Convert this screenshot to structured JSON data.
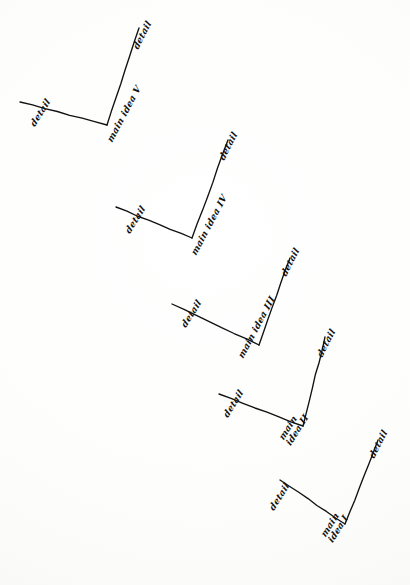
{
  "diagram": {
    "medium": "hand-drawn pen sketch on white paper",
    "ink_color": "#111111",
    "paper_color": "#fefefe",
    "shape_count": 5,
    "shape_type": "v-shape",
    "units": [
      {
        "id": "unit-5",
        "main_label_line1": "main",
        "main_label_line2": "idea",
        "numeral": "V",
        "main_label_full": "main idea V",
        "main_label_single_line": true,
        "left_detail_label": "detail",
        "right_detail_label": "detail",
        "vertex": {
          "x": 107,
          "y": 125
        },
        "left_tip": {
          "x": 20,
          "y": 102
        },
        "right_tip": {
          "x": 139,
          "y": 28
        },
        "main_label_pos": {
          "x": 110,
          "y": 137,
          "rotate": -62
        },
        "left_label_pos": {
          "x": 33,
          "y": 121,
          "rotate": -58
        },
        "right_label_pos": {
          "x": 136,
          "y": 44,
          "rotate": -63
        }
      },
      {
        "id": "unit-4",
        "main_label_line1": "main",
        "main_label_line2": "idea",
        "numeral": "IV",
        "main_label_full": "main idea IV",
        "main_label_single_line": true,
        "left_detail_label": "detail",
        "right_detail_label": "detail",
        "vertex": {
          "x": 192,
          "y": 238
        },
        "left_tip": {
          "x": 116,
          "y": 207
        },
        "right_tip": {
          "x": 228,
          "y": 140
        },
        "main_label_pos": {
          "x": 194,
          "y": 250,
          "rotate": -62
        },
        "left_label_pos": {
          "x": 128,
          "y": 228,
          "rotate": -58
        },
        "right_label_pos": {
          "x": 222,
          "y": 155,
          "rotate": -63
        }
      },
      {
        "id": "unit-3",
        "main_label_line1": "main",
        "main_label_line2": "idea",
        "numeral": "III",
        "main_label_full": "main idea III",
        "main_label_single_line": true,
        "left_detail_label": "detail",
        "right_detail_label": "detail",
        "vertex": {
          "x": 259,
          "y": 345
        },
        "left_tip": {
          "x": 172,
          "y": 304
        },
        "right_tip": {
          "x": 290,
          "y": 258
        },
        "main_label_pos": {
          "x": 241,
          "y": 353,
          "rotate": -62
        },
        "left_label_pos": {
          "x": 184,
          "y": 322,
          "rotate": -58
        },
        "right_label_pos": {
          "x": 284,
          "y": 271,
          "rotate": -63
        }
      },
      {
        "id": "unit-2",
        "main_label_line1": "main",
        "main_label_line2": "idea",
        "numeral": "II",
        "main_label_full": "main idea II",
        "main_label_single_line": false,
        "left_detail_label": "detail",
        "right_detail_label": "detail",
        "vertex": {
          "x": 303,
          "y": 426
        },
        "left_tip": {
          "x": 219,
          "y": 394
        },
        "right_tip": {
          "x": 325,
          "y": 337
        },
        "main_label_pos": {
          "x": 285,
          "y": 433,
          "rotate": -58
        },
        "left_label_pos": {
          "x": 226,
          "y": 412,
          "rotate": -58
        },
        "right_label_pos": {
          "x": 320,
          "y": 352,
          "rotate": -63
        }
      },
      {
        "id": "unit-1",
        "main_label_line1": "main",
        "main_label_line2": "idea",
        "numeral": "I",
        "main_label_full": "main idea I",
        "main_label_single_line": false,
        "left_detail_label": "detail",
        "right_detail_label": "detail",
        "vertex": {
          "x": 345,
          "y": 524
        },
        "left_tip": {
          "x": 280,
          "y": 480
        },
        "right_tip": {
          "x": 378,
          "y": 440
        },
        "main_label_pos": {
          "x": 327,
          "y": 530,
          "rotate": -58
        },
        "left_label_pos": {
          "x": 272,
          "y": 505,
          "rotate": -58
        },
        "right_label_pos": {
          "x": 372,
          "y": 453,
          "rotate": -63
        }
      }
    ]
  }
}
